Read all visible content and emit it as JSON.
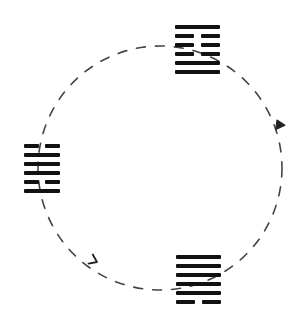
{
  "diagram": {
    "title": "Hexagram transformation cycle",
    "background": "#ffffff",
    "ink_color": "#111111",
    "circle": {
      "cx": 160,
      "cy": 168,
      "r": 122,
      "stroke": "#444444",
      "dash": "9 10",
      "style": "dashed"
    },
    "hexagrams": [
      {
        "id": "top",
        "label": "Top hexagram",
        "x": 175,
        "y": 25,
        "width": 45,
        "lines_top_to_bottom": [
          "solid",
          "broken",
          "broken",
          "broken",
          "solid",
          "solid"
        ]
      },
      {
        "id": "left",
        "label": "Left hexagram",
        "x": 24,
        "y": 144,
        "width": 36,
        "lines_top_to_bottom": [
          "broken",
          "solid",
          "solid",
          "solid",
          "broken",
          "solid"
        ]
      },
      {
        "id": "bottom",
        "label": "Bottom hexagram",
        "x": 176,
        "y": 255,
        "width": 45,
        "lines_top_to_bottom": [
          "solid",
          "solid",
          "solid",
          "solid",
          "solid",
          "broken"
        ]
      }
    ],
    "arrows": [
      {
        "id": "arrow-left-to-bottom",
        "label": "Arrow from left hexagram to bottom hexagram",
        "x": 97,
        "y": 262,
        "direction_deg": 25
      },
      {
        "id": "arrow-bottom-to-top",
        "label": "Arrow from bottom hexagram to top hexagram",
        "x": 277,
        "y": 120,
        "direction_deg": -115
      }
    ]
  }
}
